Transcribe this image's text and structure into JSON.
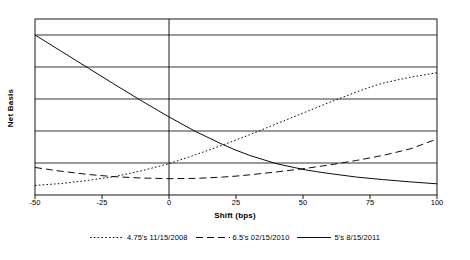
{
  "chart_data": {
    "type": "line",
    "title": "",
    "xlabel": "Shift (bps)",
    "ylabel": "Net Basis",
    "xlim": [
      -50,
      100
    ],
    "ylim": [
      0,
      55
    ],
    "grid": true,
    "grid_axis": "y",
    "legend_position": "bottom",
    "xticks": [
      -50,
      -25,
      0,
      25,
      50,
      75,
      100
    ],
    "xticklabels": [
      "-50",
      "-25",
      "0",
      "25",
      "50",
      "75",
      "100"
    ],
    "yticks": [
      10,
      20,
      30,
      40,
      50
    ],
    "yticklabels": [
      "10.0",
      "20.0",
      "30.0",
      "40.0",
      "50.0"
    ],
    "x": [
      -50,
      -40,
      -30,
      -20,
      -10,
      0,
      10,
      20,
      25,
      30,
      40,
      50,
      55,
      60,
      70,
      75,
      80,
      90,
      100
    ],
    "series": [
      {
        "name": "4.75's 11/15/2008",
        "style": "dotted",
        "color": "#000000",
        "values": [
          3.0,
          3.6,
          4.6,
          5.8,
          7.6,
          9.8,
          12.6,
          15.6,
          17.2,
          18.8,
          22.2,
          25.6,
          27.3,
          29.0,
          32.2,
          33.7,
          35.0,
          36.8,
          38.2
        ]
      },
      {
        "name": "6.5's 02/15/2010",
        "style": "dashed",
        "color": "#000000",
        "values": [
          8.6,
          7.4,
          6.4,
          5.7,
          5.3,
          5.1,
          5.2,
          5.6,
          5.9,
          6.3,
          7.2,
          8.2,
          8.8,
          9.4,
          10.8,
          11.6,
          12.4,
          14.4,
          17.5
        ]
      },
      {
        "name": "5's 8/15/2011",
        "style": "solid",
        "color": "#000000",
        "values": [
          50.0,
          44.8,
          39.6,
          34.4,
          29.3,
          24.4,
          19.8,
          15.8,
          14.0,
          12.4,
          9.8,
          8.0,
          7.3,
          6.7,
          5.6,
          5.2,
          4.8,
          4.1,
          3.5
        ]
      }
    ]
  },
  "legend": {
    "items": [
      {
        "label": "4.75's 11/15/2008",
        "style": "dotted"
      },
      {
        "label": "6.5's 02/15/2010",
        "style": "dashed"
      },
      {
        "label": "5's 8/15/2011",
        "style": "solid"
      }
    ]
  },
  "axes": {
    "x_title": "Shift (bps)",
    "y_title": "Net Basis"
  }
}
